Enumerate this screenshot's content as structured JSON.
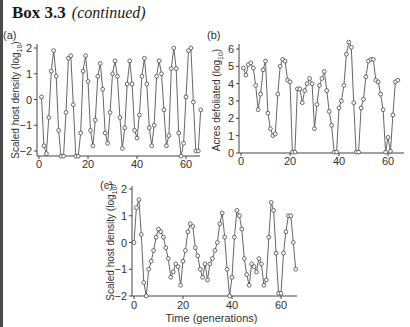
{
  "header": {
    "box_label": "Box 3.3",
    "continued": "(continued)"
  },
  "panels": [
    {
      "id": "a",
      "label": "(a)",
      "ylabel": "Scaled host density (log10)",
      "xlabel": ""
    },
    {
      "id": "b",
      "label": "(b)",
      "ylabel": "Acres defoliated (log10)",
      "xlabel": ""
    },
    {
      "id": "c",
      "label": "(c)",
      "ylabel": "Scaled host density (log10)",
      "xlabel": "Time (generations)"
    }
  ],
  "colors": {
    "line": "#555555",
    "marker_stroke": "#444444",
    "axis": "#444444",
    "text": "#333333"
  },
  "chart_data": [
    {
      "type": "line",
      "panel": "(a)",
      "title": "",
      "xlabel": "",
      "ylabel": "Scaled host density (log10)",
      "xlim": [
        0,
        65
      ],
      "ylim": [
        -2.2,
        2
      ],
      "xticks": [
        0,
        20,
        40,
        60
      ],
      "yticks": [
        -2,
        -1,
        0,
        1,
        2
      ],
      "grid": false,
      "markers": "open-circle",
      "x_start": 1,
      "values": [
        0.1,
        -1.8,
        -2.1,
        -0.7,
        1.1,
        1.9,
        0.9,
        -1.2,
        -2.2,
        -2.2,
        -0.5,
        1.6,
        1.7,
        -0.2,
        -2.2,
        -2.2,
        -1.3,
        1.1,
        1.7,
        0.7,
        -1.2,
        -1.8,
        -0.8,
        0.9,
        1.4,
        0.4,
        -1.3,
        -1.7,
        -0.5,
        1.0,
        1.5,
        0.9,
        -0.7,
        -1.9,
        -1.1,
        0.6,
        1.5,
        0.6,
        -1.2,
        -1.5,
        -0.6,
        0.9,
        1.6,
        0.6,
        -1.1,
        -1.8,
        -1.0,
        0.9,
        1.5,
        1.0,
        -0.4,
        -1.8,
        -1.4,
        1.2,
        2.0,
        1.2,
        -1.3,
        -2.2,
        -1.7,
        0.1,
        1.9,
        2.0,
        -0.1,
        -2.0,
        -2.0,
        -0.4
      ]
    },
    {
      "type": "line",
      "panel": "(b)",
      "title": "",
      "xlabel": "",
      "ylabel": "Acres defoliated (log10)",
      "xlim": [
        0,
        65
      ],
      "ylim": [
        0,
        6.4
      ],
      "xticks": [
        0,
        20,
        40,
        60
      ],
      "yticks": [
        0,
        1,
        2,
        3,
        4,
        5,
        6
      ],
      "grid": false,
      "markers": "open-circle",
      "x_start": 1,
      "values": [
        4.9,
        4.5,
        5.1,
        5.2,
        4.9,
        3.9,
        2.5,
        3.4,
        4.8,
        5.3,
        2.3,
        1.4,
        1.0,
        1.1,
        3.4,
        5.0,
        5.4,
        5.3,
        4.2,
        4.1,
        0.05,
        0.05,
        3.7,
        3.7,
        2.9,
        3.6,
        4.0,
        4.3,
        4.0,
        1.4,
        2.8,
        3.9,
        4.3,
        4.7,
        3.6,
        2.4,
        1.6,
        0.05,
        0.05,
        2.6,
        3.0,
        3.9,
        5.7,
        6.4,
        6.1,
        2.9,
        0.05,
        0.05,
        2.6,
        3.1,
        4.4,
        5.3,
        5.4,
        5.4,
        4.2,
        4.1,
        3.4,
        2.5,
        0.05,
        0.9,
        0.1,
        2.2,
        4.1,
        4.2
      ]
    },
    {
      "type": "line",
      "panel": "(c)",
      "title": "",
      "xlabel": "Time (generations)",
      "ylabel": "Scaled host density (log10)",
      "xlim": [
        0,
        67
      ],
      "ylim": [
        -2,
        2
      ],
      "xticks": [
        0,
        20,
        40,
        60
      ],
      "yticks": [
        -2,
        -1,
        0,
        1,
        2
      ],
      "grid": false,
      "markers": "open-circle",
      "x_start": 0,
      "values": [
        0.0,
        1.3,
        1.6,
        0.3,
        -1.5,
        -2.0,
        -1.0,
        -0.7,
        -0.3,
        0.2,
        0.5,
        0.4,
        0.2,
        -0.2,
        -0.6,
        -1.3,
        -1.1,
        -0.8,
        -0.9,
        -1.6,
        -0.7,
        -0.3,
        0.4,
        0.7,
        0.6,
        -0.2,
        -0.5,
        -1.0,
        -1.3,
        -0.8,
        -1.4,
        -0.8,
        -0.6,
        -0.3,
        0.0,
        0.7,
        1.1,
        0.2,
        -1.0,
        -2.0,
        -1.3,
        0.2,
        1.2,
        1.0,
        0.5,
        -0.6,
        -1.2,
        -1.6,
        -0.8,
        -0.9,
        -1.1,
        -0.6,
        -0.8,
        -1.6,
        -1.4,
        0.2,
        1.5,
        1.2,
        -0.4,
        -1.9,
        -1.9,
        -0.4,
        0.4,
        1.0,
        1.0,
        0.0,
        -1.0
      ]
    }
  ]
}
